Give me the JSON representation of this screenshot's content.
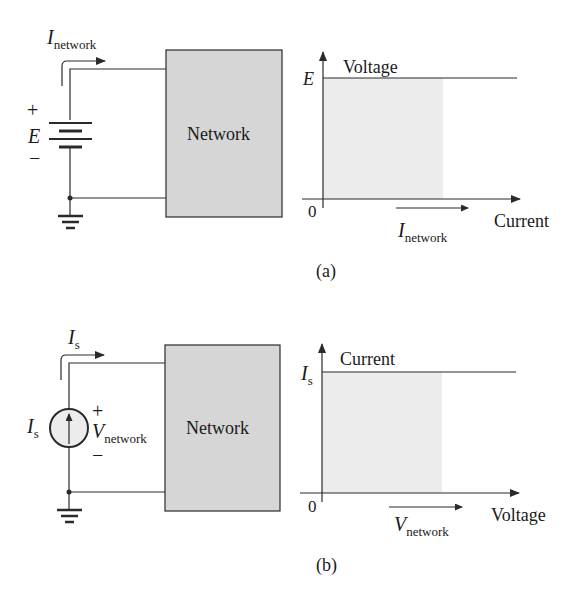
{
  "figure_a": {
    "caption": "(a)",
    "source_symbol": "E",
    "plus": "+",
    "minus": "−",
    "current_label": {
      "main": "I",
      "sub": "network"
    },
    "network_label": "Network",
    "graph": {
      "y_axis_label": "Voltage",
      "x_axis_label": "Current",
      "level_label": "E",
      "origin_label": "0",
      "arrow_label": {
        "main": "I",
        "sub": "network"
      }
    }
  },
  "figure_b": {
    "caption": "(b)",
    "source_symbol": {
      "main": "I",
      "sub": "s"
    },
    "plus": "+",
    "minus": "−",
    "current_label": {
      "main": "I",
      "sub": "s"
    },
    "voltage_label": {
      "main": "V",
      "sub": "network"
    },
    "network_label": "Network",
    "graph": {
      "y_axis_label": "Current",
      "x_axis_label": "Voltage",
      "level_label": {
        "main": "I",
        "sub": "s"
      },
      "origin_label": "0",
      "arrow_label": {
        "main": "V",
        "sub": "network"
      }
    }
  },
  "colors": {
    "line": "#2a2a2a",
    "network_fill": "#d6d6d6",
    "graph_fill": "#ececec"
  }
}
